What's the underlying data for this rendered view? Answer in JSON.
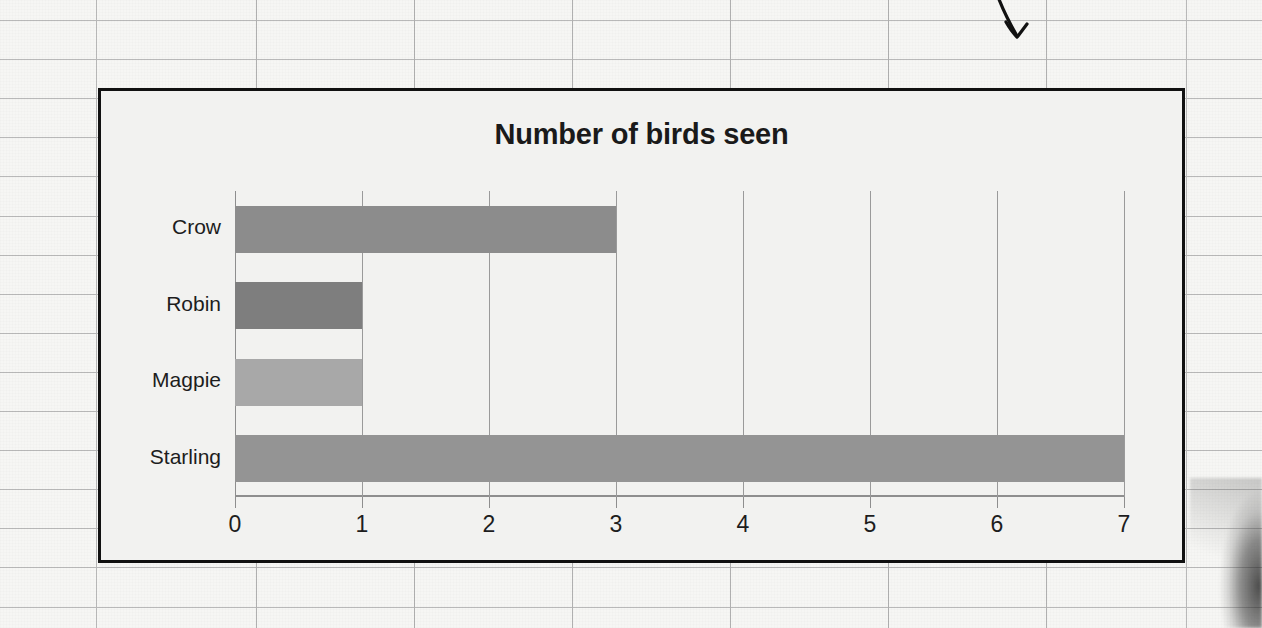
{
  "chart_data": {
    "type": "bar",
    "orientation": "horizontal",
    "title": "Number of birds seen",
    "xlabel": "",
    "ylabel": "",
    "categories": [
      "Crow",
      "Robin",
      "Magpie",
      "Starling"
    ],
    "values": [
      3,
      1,
      1,
      7
    ],
    "bar_colors": [
      "#8c8c8c",
      "#7e7e7e",
      "#a8a8a8",
      "#949494"
    ],
    "xlim": [
      0,
      7
    ],
    "xticks": [
      0,
      1,
      2,
      3,
      4,
      5,
      6,
      7
    ],
    "xtick_labels": [
      "0",
      "1",
      "2",
      "3",
      "4",
      "5",
      "6",
      "7"
    ],
    "grid": "vertical-only",
    "legend": "none",
    "plot_background": "#f2f2f0"
  },
  "page": {
    "background_color": "#f6f6f4",
    "rule_color": "#b9b9b9",
    "chart_border_color": "#111111"
  },
  "annotation": {
    "arrow_name": "hand-drawn-down-arrow",
    "arrow_color": "#111111",
    "points_to": "chart top-right region"
  }
}
